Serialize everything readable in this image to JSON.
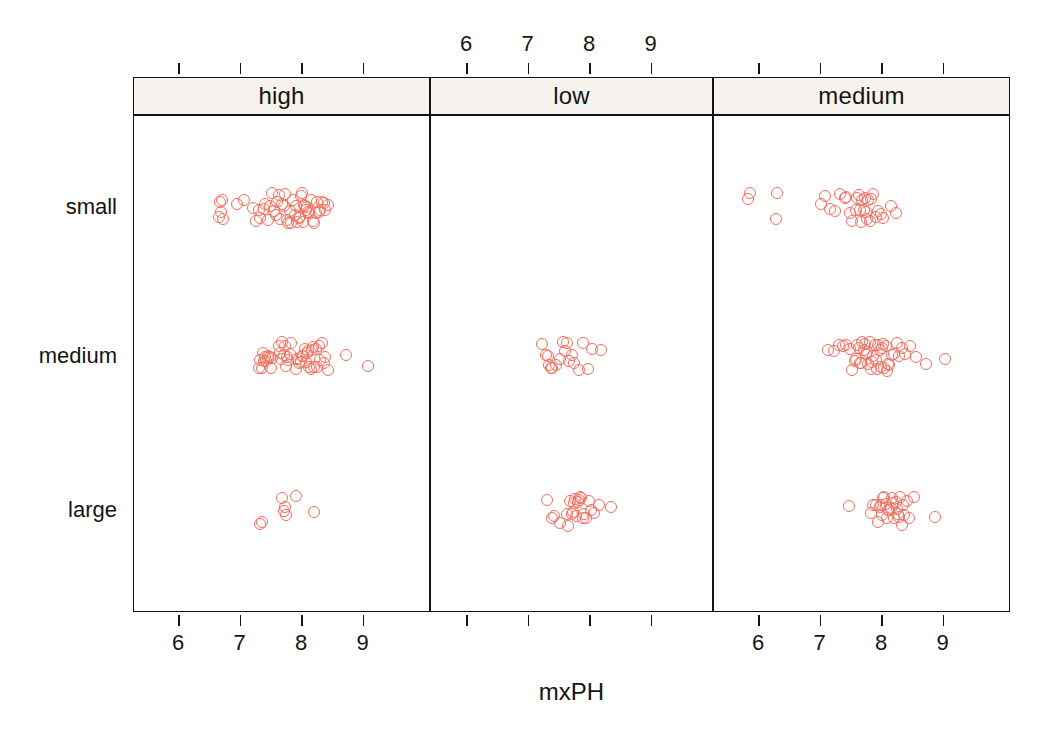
{
  "chart_data": {
    "type": "scatter",
    "plot_style": "lattice-stripplot",
    "title": "",
    "xlabel": "mxPH",
    "ylabel": "",
    "xlim": [
      5.55,
      9.75
    ],
    "xticks": [
      6,
      7,
      8,
      9
    ],
    "xtick_labels": [
      "6",
      "7",
      "8",
      "9"
    ],
    "grid": false,
    "legend": "none",
    "marker": {
      "shape": "open-circle",
      "color": "#ee6f5e",
      "size_px": 12,
      "stroke_px": 1.7
    },
    "strip_background": "#f6f3ee",
    "axis_color": "#141414",
    "panel_variable": "season",
    "panels": [
      "high",
      "low",
      "medium"
    ],
    "y_categories": [
      "small",
      "medium",
      "large"
    ],
    "axis_label_placement": {
      "top": [
        "low"
      ],
      "bottom": [
        "high",
        "medium"
      ]
    },
    "series": [
      {
        "panel": "high",
        "category": "small",
        "n": 54,
        "values": [
          6.65,
          6.67,
          6.68,
          6.7,
          6.72,
          6.95,
          7.05,
          7.2,
          7.25,
          7.3,
          7.32,
          7.38,
          7.4,
          7.45,
          7.48,
          7.52,
          7.55,
          7.58,
          7.6,
          7.62,
          7.65,
          7.68,
          7.7,
          7.72,
          7.75,
          7.78,
          7.8,
          7.82,
          7.85,
          7.88,
          7.9,
          7.92,
          7.95,
          7.96,
          7.98,
          8.0,
          8.02,
          8.04,
          8.05,
          8.06,
          8.08,
          8.1,
          8.12,
          8.15,
          8.18,
          8.2,
          8.22,
          8.25,
          8.28,
          8.3,
          8.32,
          8.35,
          8.38,
          8.42
        ]
      },
      {
        "panel": "high",
        "category": "medium",
        "n": 48,
        "values": [
          7.3,
          7.32,
          7.35,
          7.36,
          7.38,
          7.4,
          7.42,
          7.44,
          7.45,
          7.48,
          7.5,
          7.52,
          7.62,
          7.64,
          7.66,
          7.68,
          7.7,
          7.72,
          7.74,
          7.76,
          7.78,
          7.8,
          7.82,
          7.9,
          7.92,
          7.95,
          7.98,
          8.0,
          8.02,
          8.05,
          8.06,
          8.08,
          8.1,
          8.12,
          8.15,
          8.16,
          8.18,
          8.2,
          8.22,
          8.25,
          8.28,
          8.3,
          8.32,
          8.35,
          8.38,
          8.42,
          8.72,
          9.08
        ]
      },
      {
        "panel": "high",
        "category": "large",
        "n": 8,
        "values": [
          7.32,
          7.35,
          7.68,
          7.7,
          7.72,
          7.74,
          7.9,
          8.2
        ]
      },
      {
        "panel": "low",
        "category": "small",
        "n": 0,
        "values": []
      },
      {
        "panel": "low",
        "category": "medium",
        "n": 19,
        "values": [
          7.22,
          7.28,
          7.32,
          7.34,
          7.36,
          7.38,
          7.45,
          7.52,
          7.56,
          7.6,
          7.62,
          7.66,
          7.7,
          7.74,
          7.82,
          7.88,
          7.96,
          8.04,
          8.18
        ]
      },
      {
        "panel": "low",
        "category": "large",
        "n": 24,
        "values": [
          7.3,
          7.38,
          7.42,
          7.52,
          7.62,
          7.65,
          7.68,
          7.7,
          7.72,
          7.74,
          7.76,
          7.78,
          7.8,
          7.82,
          7.84,
          7.86,
          7.88,
          7.9,
          7.94,
          7.98,
          8.02,
          8.06,
          8.14,
          8.34
        ]
      },
      {
        "panel": "medium",
        "category": "small",
        "n": 33,
        "values": [
          5.82,
          5.86,
          6.28,
          6.3,
          7.0,
          7.08,
          7.16,
          7.24,
          7.32,
          7.4,
          7.42,
          7.48,
          7.52,
          7.58,
          7.6,
          7.62,
          7.64,
          7.66,
          7.68,
          7.7,
          7.72,
          7.74,
          7.76,
          7.78,
          7.8,
          7.82,
          7.86,
          7.9,
          7.94,
          7.98,
          8.02,
          8.14,
          8.22
        ]
      },
      {
        "panel": "medium",
        "category": "medium",
        "n": 46,
        "values": [
          7.12,
          7.22,
          7.3,
          7.36,
          7.42,
          7.48,
          7.52,
          7.56,
          7.58,
          7.6,
          7.62,
          7.64,
          7.66,
          7.68,
          7.7,
          7.72,
          7.74,
          7.76,
          7.78,
          7.8,
          7.82,
          7.84,
          7.86,
          7.88,
          7.9,
          7.92,
          7.94,
          7.96,
          7.98,
          8.0,
          8.02,
          8.04,
          8.06,
          8.08,
          8.1,
          8.12,
          8.16,
          8.2,
          8.24,
          8.28,
          8.32,
          8.38,
          8.46,
          8.56,
          8.72,
          9.02
        ]
      },
      {
        "panel": "medium",
        "category": "large",
        "n": 30,
        "values": [
          7.46,
          7.82,
          7.86,
          7.9,
          7.94,
          7.96,
          7.98,
          8.0,
          8.02,
          8.04,
          8.06,
          8.08,
          8.1,
          8.12,
          8.14,
          8.16,
          8.18,
          8.2,
          8.22,
          8.24,
          8.26,
          8.28,
          8.3,
          8.32,
          8.34,
          8.36,
          8.4,
          8.44,
          8.52,
          8.86
        ]
      }
    ]
  },
  "axis": {
    "x_title": "mxPH",
    "tick_labels": [
      "6",
      "7",
      "8",
      "9"
    ],
    "y_labels": [
      "small",
      "medium",
      "large"
    ]
  },
  "strips": {
    "items": [
      {
        "label": "high"
      },
      {
        "label": "low"
      },
      {
        "label": "medium"
      }
    ]
  }
}
